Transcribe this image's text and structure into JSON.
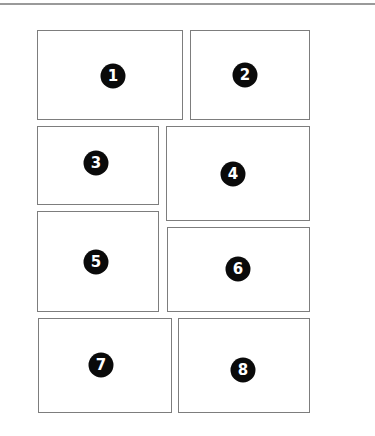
{
  "diagram": {
    "colors": {
      "border": "#7d7d7d",
      "badge": "#0a0a0a",
      "badge_text": "#ffffff",
      "rule": "#9a9a9a"
    },
    "panels": [
      {
        "label": "1"
      },
      {
        "label": "2"
      },
      {
        "label": "3"
      },
      {
        "label": "4"
      },
      {
        "label": "5"
      },
      {
        "label": "6"
      },
      {
        "label": "7"
      },
      {
        "label": "8"
      }
    ]
  }
}
